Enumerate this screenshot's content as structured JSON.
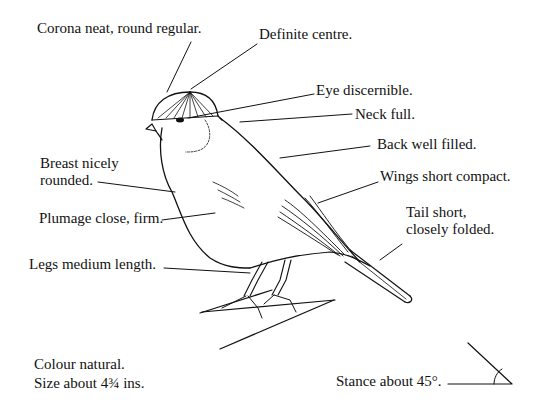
{
  "diagram": {
    "type": "annotated-illustration",
    "ink_color": "#111111",
    "background": "#ffffff",
    "labels": {
      "corona": "Corona neat, round regular.",
      "centre": "Definite centre.",
      "eye": "Eye discernible.",
      "neck": "Neck full.",
      "back": "Back well filled.",
      "wings": "Wings short compact.",
      "tail_1": "Tail short,",
      "tail_2": "closely folded.",
      "breast_1": "Breast nicely",
      "breast_2": "rounded.",
      "plumage": "Plumage close, firm.",
      "legs": "Legs medium length.",
      "colour": "Colour natural.",
      "size": "Size about 4¾ ins.",
      "stance": "Stance about 45°."
    }
  }
}
